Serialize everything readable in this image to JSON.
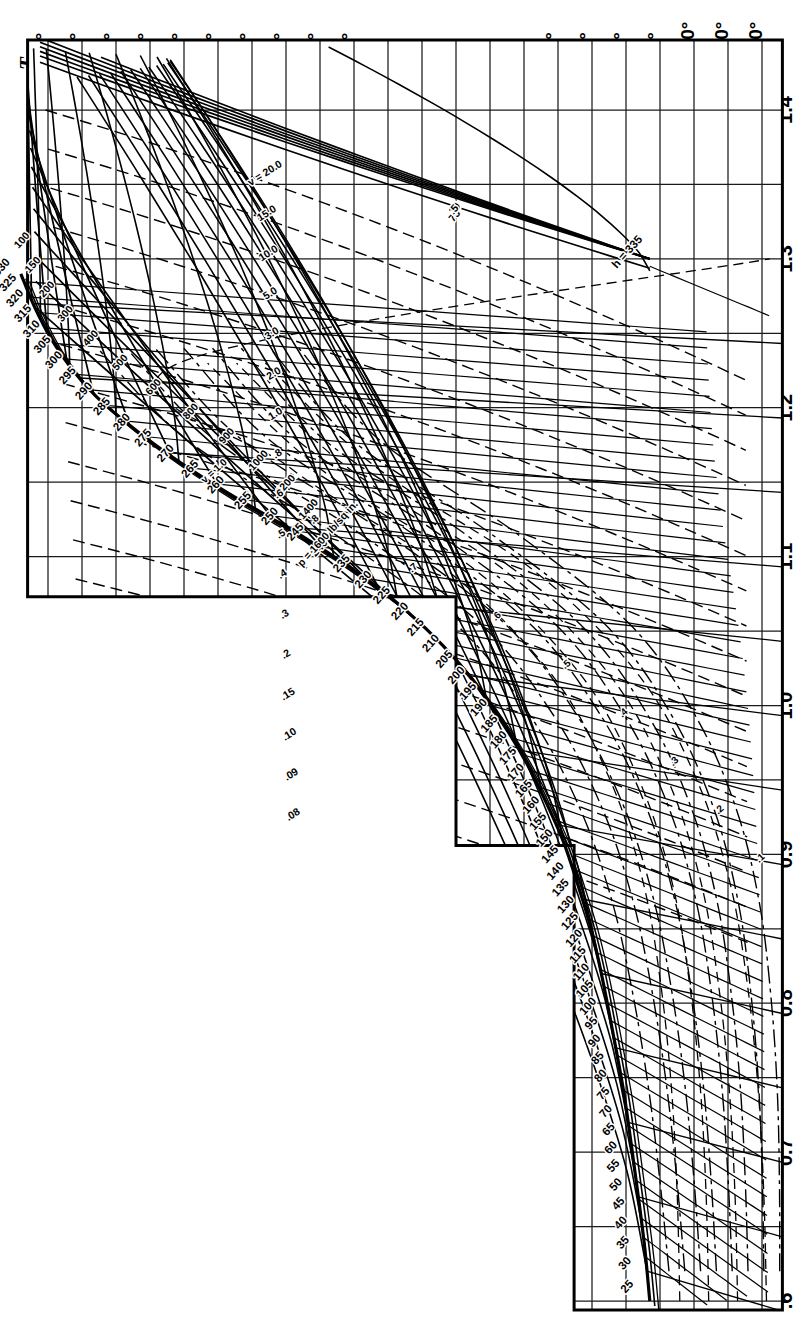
{
  "chart_data": {
    "type": "line",
    "orientation": "rotated-90-ccw",
    "xlabel": "T",
    "ylabel": "",
    "grid": true,
    "legend": "none",
    "axes": {
      "temperature": {
        "symbol": "T",
        "unit": "degF",
        "ticks": [
          "280°",
          "260°",
          "240°",
          "220°",
          "200°",
          "180°",
          "160°",
          "140°",
          "120°",
          "100°",
          "80°",
          "60°",
          "40°",
          "32°",
          "20°",
          "0",
          "−20°",
          "−40°",
          "−60°",
          "−80°",
          "−100°",
          "−120°",
          "−140°"
        ],
        "values": [
          280,
          260,
          240,
          220,
          200,
          180,
          160,
          140,
          120,
          100,
          80,
          60,
          40,
          32,
          20,
          0,
          -20,
          -40,
          -60,
          -80,
          -100,
          -120,
          -140
        ],
        "range": [
          300,
          -150
        ]
      },
      "entropy": {
        "symbol": "s",
        "ticks": [
          "1.4",
          "1.3",
          "1.2",
          "1.1",
          "1.0",
          "0.9",
          "0.8",
          "0.7",
          ".6"
        ],
        "values": [
          1.4,
          1.3,
          1.2,
          1.1,
          1.0,
          0.9,
          0.8,
          0.7,
          0.6
        ],
        "range": [
          0.6,
          1.45
        ]
      }
    },
    "enthalpy_lines": {
      "label_prefix": "h =",
      "first_label": "h = 335",
      "values": [
        335,
        330,
        325,
        320,
        315,
        310,
        305,
        300,
        295,
        290,
        285,
        280,
        275,
        270,
        265,
        260,
        255,
        250,
        245,
        240,
        235,
        230,
        225,
        220,
        215,
        210,
        205,
        200,
        195,
        190,
        185,
        180,
        175,
        170,
        165,
        160,
        155,
        150,
        145,
        140,
        135,
        130,
        125,
        120,
        115,
        110,
        105,
        100,
        95,
        90,
        85,
        80,
        75,
        70,
        65,
        60,
        55,
        50,
        45,
        40,
        35,
        30,
        25
      ],
      "labels": [
        "335",
        "330",
        "325",
        "320",
        "315",
        "310",
        "305",
        "300",
        "295",
        "290",
        "285",
        "280",
        "275",
        "270",
        "265",
        "260",
        "255",
        "250",
        "245",
        "240",
        "235",
        "230",
        "225",
        "220",
        "215",
        "210",
        "205",
        "200",
        "195",
        "190",
        "185",
        "180",
        "175",
        "170",
        "165",
        "160",
        "155",
        "150",
        "145",
        "140",
        "135",
        "130",
        "125",
        "120",
        "115",
        "110",
        "105",
        "100",
        "95",
        "90",
        "85",
        "80",
        "75",
        "70",
        "65",
        "60",
        "55",
        "50",
        "45",
        "40",
        "35",
        "30",
        "25"
      ]
    },
    "pressure_lines": {
      "label_prefix": "p =",
      "first_label": "p = 1600 lb/sq in.",
      "unit": "lb/sq in.",
      "values": [
        1600,
        1400,
        1200,
        1000,
        900,
        800,
        600,
        500,
        400,
        300,
        200,
        150,
        100,
        75,
        50,
        25,
        20,
        15,
        10,
        5
      ],
      "labels": [
        "1600",
        "1400",
        "1200",
        "1000",
        "900",
        "800",
        "600",
        "500",
        "400",
        "300",
        "200",
        "150",
        "100",
        "75",
        "50",
        "25",
        "20",
        "15",
        "10",
        "5"
      ]
    },
    "volume_lines": {
      "label_prefix": "v =",
      "first_label": "v = 20.0",
      "values": [
        20.0,
        15.0,
        10.0,
        5.0,
        3.0,
        2.0,
        1.0,
        0.8,
        0.6,
        0.5,
        0.4,
        0.3,
        0.2,
        0.15,
        0.1,
        0.09,
        0.08
      ],
      "labels": [
        "20.0",
        "15.0",
        "10.0",
        "5.0",
        "3.0",
        "2.0",
        "1.0",
        ".8",
        ".6",
        ".5",
        ".4",
        ".3",
        ".2",
        ".15",
        ".10",
        ".09",
        ".08"
      ]
    },
    "moisture_lines": {
      "label_prefix": "v =",
      "labels": [
        "1.0",
        ".8",
        ".7",
        ".6",
        ".5",
        ".4",
        ".3",
        ".2",
        ".1"
      ],
      "values": [
        1.0,
        0.8,
        0.7,
        0.6,
        0.5,
        0.4,
        0.3,
        0.2,
        0.1
      ]
    },
    "wet_volume_lines": {
      "labels": [
        "15.0",
        "10.0",
        "5.0",
        "3.0",
        "1.0",
        ".5",
        ".4",
        ".3",
        ".2",
        ".1"
      ],
      "values": [
        15.0,
        10.0,
        5.0,
        3.0,
        1.0,
        0.5,
        0.4,
        0.3,
        0.2,
        0.1
      ]
    }
  }
}
